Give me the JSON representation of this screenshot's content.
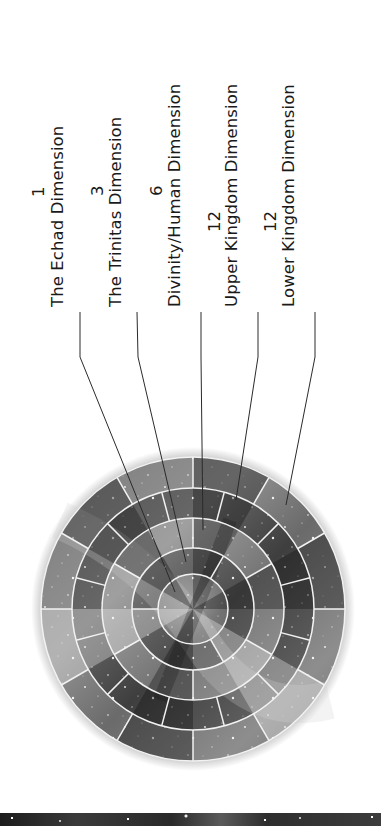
{
  "diagram": {
    "orientation": "rotated -90deg (text reads bottom-to-top)",
    "colors": {
      "text": "#1a1a1a",
      "leader_lines": "#2a2a2a",
      "ring_dividers": "#f2f2f2",
      "background": "#ffffff"
    },
    "labels": [
      {
        "count": "1",
        "name": "The Echad Dimension"
      },
      {
        "count": "3",
        "name": "The Trinitas Dimension"
      },
      {
        "count": "6",
        "name": "Divinity/Human Dimension"
      },
      {
        "count": "12",
        "name": "Upper Kingdom Dimension"
      },
      {
        "count": "12",
        "name": "Lower Kingdom Dimension"
      }
    ],
    "rings": [
      {
        "name": "The Echad Dimension",
        "segments": 1
      },
      {
        "name": "The Trinitas Dimension",
        "segments": 3
      },
      {
        "name": "Divinity/Human Dimension",
        "segments": 6
      },
      {
        "name": "Upper Kingdom Dimension",
        "segments": 12
      },
      {
        "name": "Lower Kingdom Dimension",
        "segments": 12
      }
    ],
    "background_imagery": "grayscale galaxy / starfield texture"
  }
}
